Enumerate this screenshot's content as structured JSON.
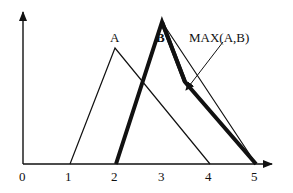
{
  "diagram": {
    "labels": {
      "a": "A",
      "b": "B",
      "max": "MAX(A,B)"
    },
    "x_ticks": [
      "0",
      "1",
      "2",
      "3",
      "4",
      "5"
    ],
    "series": [
      {
        "name": "A",
        "points": [
          [
            1,
            0
          ],
          [
            2,
            1
          ],
          [
            4,
            0
          ]
        ],
        "style": "thin"
      },
      {
        "name": "B",
        "points": [
          [
            2,
            0
          ],
          [
            3,
            1.2
          ],
          [
            5,
            0
          ]
        ],
        "style": "thin"
      },
      {
        "name": "MAX(A,B)",
        "points": [
          [
            2,
            0
          ],
          [
            3,
            1.2
          ],
          [
            3.5,
            0.7
          ],
          [
            5,
            0
          ]
        ],
        "style": "bold"
      }
    ],
    "colors": {
      "line": "#111111",
      "background": "#ffffff"
    }
  }
}
